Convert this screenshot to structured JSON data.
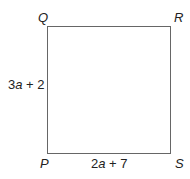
{
  "vertices": {
    "top_left": "Q",
    "top_right": "R",
    "bottom_left": "P",
    "bottom_right": "S"
  },
  "sides": {
    "left": {
      "coef": "3",
      "var": "a",
      "rest": " + 2"
    },
    "bottom": {
      "coef": "2",
      "var": "a",
      "rest": " + 7"
    }
  },
  "colors": {
    "stroke": "#666666",
    "text": "#222222",
    "background": "#ffffff"
  }
}
